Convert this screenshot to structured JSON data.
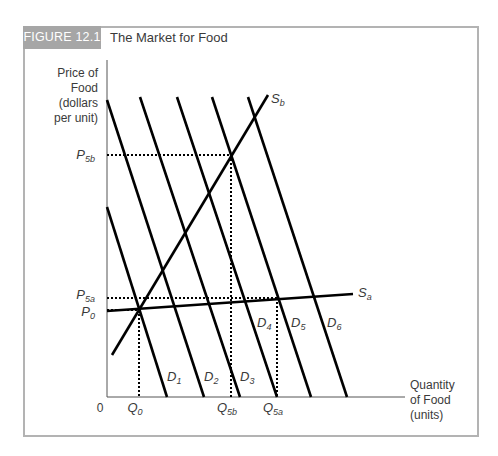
{
  "figure": {
    "tag": "FIGURE 12.1",
    "title": "The Market for Food"
  },
  "colors": {
    "frame": "#b3b3b3",
    "tag_bg": "#a6a6a6",
    "lines": "#000000",
    "text": "#3a3a3a"
  },
  "chart_data": {
    "type": "line",
    "title": "The Market for Food",
    "xlabel": "Quantity of Food (units)",
    "ylabel": "Price of Food (dollars per unit)",
    "ylabel_lines": [
      "Price of",
      "Food",
      "(dollars",
      "per unit)"
    ],
    "xlabel_lines": [
      "Quantity",
      "of Food",
      "(units)"
    ],
    "origin_label": "0",
    "grid": false,
    "legend": "none (curves labeled directly)",
    "x_ticks": [
      {
        "label": "Q",
        "sub": "0",
        "x_px": 139
      },
      {
        "label": "Q",
        "sub": "5b",
        "x_px": 231
      },
      {
        "label": "Q",
        "sub": "5a",
        "x_px": 277
      }
    ],
    "y_ticks": [
      {
        "label": "P",
        "sub": "5b",
        "y_px": 155
      },
      {
        "label": "P",
        "sub": "5a",
        "y_px": 298
      },
      {
        "label": "P",
        "sub": "0",
        "y_px": 310
      }
    ],
    "series": [
      {
        "name": "D1",
        "label": "D",
        "sub": "1",
        "kind": "demand",
        "points_px": [
          [
            107,
            207
          ],
          [
            167,
            397
          ]
        ]
      },
      {
        "name": "D2",
        "label": "D",
        "sub": "2",
        "kind": "demand",
        "points_px": [
          [
            107,
            100
          ],
          [
            204,
            397
          ]
        ]
      },
      {
        "name": "D3",
        "label": "D",
        "sub": "3",
        "kind": "demand",
        "points_px": [
          [
            140,
            97
          ],
          [
            240,
            397
          ]
        ]
      },
      {
        "name": "D4",
        "label": "D",
        "sub": "4",
        "kind": "demand",
        "points_px": [
          [
            177,
            97
          ],
          [
            277,
            397
          ]
        ]
      },
      {
        "name": "D5",
        "label": "D",
        "sub": "5",
        "kind": "demand",
        "points_px": [
          [
            212,
            97
          ],
          [
            311,
            397
          ]
        ]
      },
      {
        "name": "D6",
        "label": "D",
        "sub": "6",
        "kind": "demand",
        "points_px": [
          [
            248,
            97
          ],
          [
            347,
            397
          ]
        ]
      },
      {
        "name": "Sa",
        "label": "S",
        "sub": "a",
        "kind": "supply (elastic)",
        "points_px": [
          [
            107,
            311
          ],
          [
            353,
            294
          ]
        ]
      },
      {
        "name": "Sb",
        "label": "S",
        "sub": "b",
        "kind": "supply (inelastic)",
        "points_px": [
          [
            112,
            355
          ],
          [
            268,
            95
          ]
        ]
      }
    ],
    "equilibria": [
      {
        "name": "initial",
        "curves": [
          "D1",
          "Sa",
          "Sb"
        ],
        "x_label": "Q0",
        "y_label": "P0",
        "point_px": [
          139,
          310
        ]
      },
      {
        "name": "with Sb after demand shift to D5",
        "curves": [
          "D5",
          "Sb"
        ],
        "x_label": "Q5b",
        "y_label": "P5b",
        "point_px": [
          231,
          155
        ]
      },
      {
        "name": "with Sa after demand shift to D5",
        "curves": [
          "D5",
          "Sa"
        ],
        "x_label": "Q5a",
        "y_label": "P5a",
        "point_px": [
          277,
          298
        ]
      }
    ],
    "axis_ranges_px": {
      "x": [
        107,
        397
      ],
      "y_origin": 397,
      "y_top": 60
    }
  }
}
